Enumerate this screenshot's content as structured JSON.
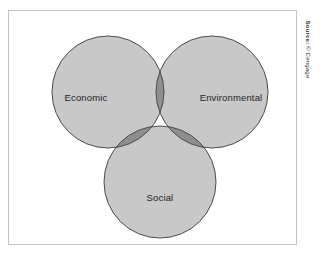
{
  "figure": {
    "source_credit": {
      "prefix": "Source:",
      "text": " © Cengage",
      "full": "Source: © Cengage"
    }
  },
  "chart_data": {
    "type": "venn",
    "title": "",
    "subtitle": "",
    "xlabel": "",
    "ylabel": "",
    "grid": false,
    "legend_position": "none",
    "set_count": 3,
    "sets": [
      {
        "id": "economic",
        "label": "Economic",
        "position": "top-left",
        "cx": 100,
        "cy": 82,
        "r": 56,
        "fill": "#c8c8c8",
        "stroke": "#4d4d4d",
        "label_x": 78,
        "label_y": 88
      },
      {
        "id": "environmental",
        "label": "Environmental",
        "position": "top-right",
        "cx": 204,
        "cy": 82,
        "r": 56,
        "fill": "#c8c8c8",
        "stroke": "#4d4d4d",
        "label_x": 223,
        "label_y": 88
      },
      {
        "id": "social",
        "label": "Social",
        "position": "bottom-center",
        "cx": 152,
        "cy": 172,
        "r": 56,
        "fill": "#c8c8c8",
        "stroke": "#4d4d4d",
        "label_x": 152,
        "label_y": 188
      }
    ],
    "overlaps": [
      {
        "id": "economic-environmental",
        "sets": [
          "economic",
          "environmental"
        ],
        "label": "",
        "fill": "#8e8e8e"
      },
      {
        "id": "economic-social",
        "sets": [
          "economic",
          "social"
        ],
        "label": "",
        "fill": "#8e8e8e"
      },
      {
        "id": "environmental-social",
        "sets": [
          "environmental",
          "social"
        ],
        "label": "",
        "fill": "#8e8e8e"
      },
      {
        "id": "economic-environmental-social",
        "sets": [
          "economic",
          "environmental",
          "social"
        ],
        "label": "",
        "fill": "#6e6e6e"
      }
    ],
    "colors": {
      "base_fill": "#c8c8c8",
      "pair_overlap_fill": "#8e8e8e",
      "triple_overlap_fill": "#6e6e6e",
      "circle_stroke": "#4d4d4d",
      "frame_stroke": "#c4c4c4",
      "label_text": "#1e1e1e",
      "background": "#ffffff"
    }
  }
}
